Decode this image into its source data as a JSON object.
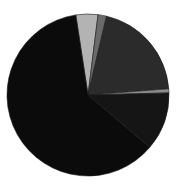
{
  "chart_data": {
    "type": "pie",
    "title": "",
    "legend": [],
    "start_angle_deg": -8.7,
    "direction": "clockwise",
    "center": [
      88,
      95
    ],
    "radius": 81,
    "slices": [
      {
        "label": "",
        "value": 4.4,
        "color": "#b3b3b3"
      },
      {
        "label": "",
        "value": 1.7,
        "color": "#6a6a6a"
      },
      {
        "label": "",
        "value": 20.1,
        "color": "#2b2b2b"
      },
      {
        "label": "",
        "value": 0.8,
        "color": "#8c8c8c"
      },
      {
        "label": "",
        "value": 11.6,
        "color": "#151515"
      },
      {
        "label": "",
        "value": 61.4,
        "color": "#0b0b0b"
      }
    ]
  }
}
